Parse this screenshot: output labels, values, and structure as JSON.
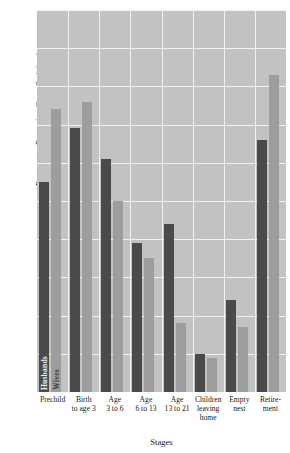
{
  "chart_data": {
    "type": "bar",
    "title": "",
    "xlabel": "Stages",
    "ylabel": "Percentage Reporting Great Satisfaction",
    "ylim": [
      0,
      100
    ],
    "ytick_labels": [
      "100",
      "90",
      "80",
      "70",
      "60",
      "50",
      "40",
      "30",
      "20",
      "10",
      "0"
    ],
    "ytick_values": [
      100,
      90,
      80,
      70,
      60,
      50,
      40,
      30,
      20,
      10,
      0
    ],
    "grid": true,
    "legend_position": "inside-first-group",
    "categories": [
      "Prechild",
      "Birth\nto age 3",
      "Age\n3 to 6",
      "Age\n6 to 13",
      "Age\n13 to 21",
      "Children\nleaving\nhome",
      "Empty\nnest",
      "Retire-\nment"
    ],
    "series": [
      {
        "name": "Husbands",
        "color": "#4a4a4a",
        "values": [
          55,
          69,
          61,
          39,
          44,
          10,
          24,
          66
        ]
      },
      {
        "name": "Wives",
        "color": "#9d9d9d",
        "values": [
          74,
          76,
          50,
          35,
          18,
          9,
          17,
          83
        ]
      }
    ]
  },
  "colors": {
    "plot_background": "#c2c2c2",
    "gridline": "#f2f2f2",
    "husbands": "#4a4a4a",
    "wives": "#9d9d9d",
    "page_background": "#ffffff",
    "text": "#1a1a1a"
  }
}
